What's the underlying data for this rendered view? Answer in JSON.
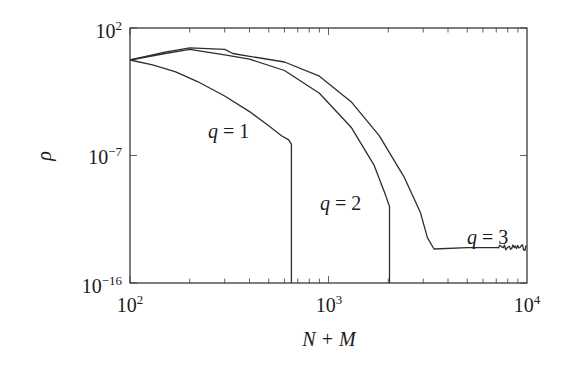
{
  "chart_data": {
    "type": "line",
    "title": "",
    "xlabel": "N + M",
    "ylabel": "ρ",
    "xscale": "log",
    "yscale": "log",
    "xlim": [
      100,
      10000
    ],
    "ylim": [
      1e-16,
      100
    ],
    "grid": false,
    "legend": "none (inline curve labels)",
    "x_ticks": [
      {
        "value": 100,
        "base": "10",
        "exp": "2"
      },
      {
        "value": 1000,
        "base": "10",
        "exp": "3"
      },
      {
        "value": 10000,
        "base": "10",
        "exp": "4"
      }
    ],
    "y_ticks": [
      {
        "value": 1e-16,
        "base": "10",
        "exp": "−16"
      },
      {
        "value": 1e-07,
        "base": "10",
        "exp": "−7"
      },
      {
        "value": 100,
        "base": "10",
        "exp": "2"
      }
    ],
    "series": [
      {
        "name": "q = 1",
        "label": {
          "q": "q",
          "eq": " = 1"
        },
        "x": [
          100,
          130,
          170,
          220,
          300,
          400,
          500,
          580,
          630,
          650,
          650
        ],
        "log10_y": [
          -0.26,
          -0.6,
          -1.1,
          -1.8,
          -2.8,
          -3.9,
          -4.9,
          -5.6,
          -5.9,
          -6.2,
          -16
        ],
        "note": "drops vertically to below 1e-16 at N+M ≈ 650"
      },
      {
        "name": "q = 2",
        "label": {
          "q": "q",
          "eq": " = 2"
        },
        "x": [
          100,
          150,
          200,
          300,
          400,
          600,
          900,
          1300,
          1700,
          1950,
          2030,
          2030
        ],
        "log10_y": [
          -0.26,
          0.2,
          0.5,
          0.1,
          -0.2,
          -1.0,
          -2.6,
          -5.0,
          -7.7,
          -9.9,
          -10.6,
          -16
        ],
        "note": "drops vertically to below 1e-16 at N+M ≈ 2030"
      },
      {
        "name": "q = 3",
        "label": {
          "q": "q",
          "eq": " = 3"
        },
        "x": [
          100,
          150,
          200,
          300,
          330,
          400,
          600,
          900,
          1300,
          1800,
          2400,
          2900,
          3150,
          3400,
          5000,
          7000,
          10000
        ],
        "log10_y": [
          -0.26,
          0.3,
          0.6,
          0.5,
          0.2,
          0.0,
          -0.4,
          -1.4,
          -3.2,
          -5.6,
          -8.5,
          -11.0,
          -12.8,
          -13.6,
          -13.5,
          -13.5,
          -13.5
        ],
        "note": "flattens into a noisy floor near 1e-13.5 beyond N+M ≈ 3400"
      }
    ]
  },
  "colors": {
    "axis": "#3a3a3a",
    "curve": "#2e2e2e",
    "background": "#ffffff"
  }
}
